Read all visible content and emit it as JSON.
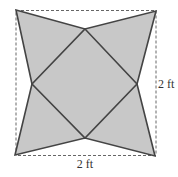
{
  "diagram": {
    "outer_square": {
      "x1": 16,
      "y1": 10,
      "x2": 156,
      "y2": 156,
      "style": "dashed"
    },
    "vertices": {
      "top_left": [
        16,
        10
      ],
      "top_right": [
        156,
        11
      ],
      "bottom_right": [
        155,
        156
      ],
      "bottom_left": [
        15,
        155
      ],
      "top_mid": [
        85,
        29
      ],
      "right_mid": [
        137,
        84
      ],
      "bottom_mid": [
        85,
        138
      ],
      "left_mid": [
        32,
        84
      ]
    },
    "colors": {
      "fill": "#c8c8c8",
      "stroke": "#444444",
      "dashed": "#666666"
    },
    "labels": {
      "right_side": "2 ft",
      "bottom_side": "2 ft"
    }
  }
}
